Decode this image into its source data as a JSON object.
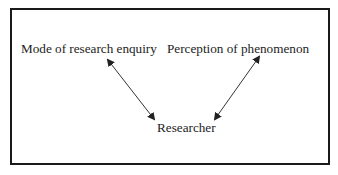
{
  "diagram": {
    "nodes": [
      {
        "id": "mode",
        "label": "Mode of research enquiry"
      },
      {
        "id": "perception",
        "label": "Perception of phenomenon"
      },
      {
        "id": "researcher",
        "label": "Researcher"
      }
    ],
    "edges": [
      {
        "from": "mode",
        "to": "researcher",
        "direction": "bidirectional"
      },
      {
        "from": "perception",
        "to": "researcher",
        "direction": "bidirectional"
      }
    ],
    "colors": {
      "border": "#1a1a1a",
      "text": "#222222",
      "arrow": "#333333"
    }
  }
}
